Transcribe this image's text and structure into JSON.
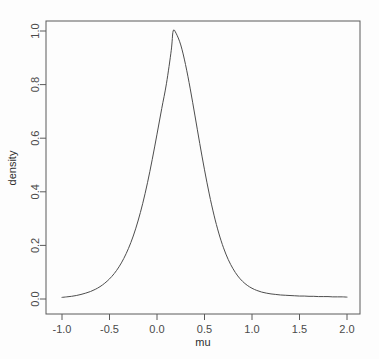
{
  "chart_data": {
    "type": "line",
    "title": "",
    "subtitle": "",
    "xlabel": "mu",
    "ylabel": "density",
    "xlim": [
      -1.0,
      2.0
    ],
    "ylim": [
      0.0,
      1.0
    ],
    "grid": false,
    "legend": null,
    "legend_position": "none",
    "box": true,
    "line_color": "#4d4d4d",
    "background_color": "#fdfdfd",
    "xticks": [
      -1.0,
      -0.5,
      0.0,
      0.5,
      1.0,
      1.5,
      2.0
    ],
    "xtick_labels": [
      "-1.0",
      "-0.5",
      "0.0",
      "0.5",
      "1.0",
      "1.5",
      "2.0"
    ],
    "yticks": [
      0.0,
      0.2,
      0.4,
      0.6,
      0.8,
      1.0
    ],
    "ytick_labels": [
      "0.0",
      "0.2",
      "0.4",
      "0.6",
      "0.8",
      "1.0"
    ],
    "series": [
      {
        "name": "density",
        "peak_x": 0.17,
        "peak_y": 1.0,
        "x": [
          -1.0,
          -0.95,
          -0.9,
          -0.85,
          -0.8,
          -0.75,
          -0.7,
          -0.65,
          -0.6,
          -0.55,
          -0.5,
          -0.45,
          -0.4,
          -0.35,
          -0.3,
          -0.25,
          -0.2,
          -0.15,
          -0.1,
          -0.05,
          0.0,
          0.05,
          0.1,
          0.15,
          0.17,
          0.2,
          0.25,
          0.3,
          0.35,
          0.4,
          0.45,
          0.5,
          0.55,
          0.6,
          0.65,
          0.7,
          0.75,
          0.8,
          0.85,
          0.9,
          0.95,
          1.0,
          1.05,
          1.1,
          1.15,
          1.2,
          1.25,
          1.3,
          1.35,
          1.4,
          1.45,
          1.5,
          1.55,
          1.6,
          1.65,
          1.7,
          1.75,
          1.8,
          1.85,
          1.9,
          1.95,
          2.0
        ],
        "y": [
          0.006,
          0.008,
          0.01,
          0.013,
          0.017,
          0.022,
          0.028,
          0.036,
          0.046,
          0.059,
          0.075,
          0.095,
          0.12,
          0.151,
          0.189,
          0.235,
          0.291,
          0.357,
          0.434,
          0.521,
          0.615,
          0.711,
          0.805,
          0.928,
          1.0,
          0.992,
          0.948,
          0.875,
          0.784,
          0.683,
          0.58,
          0.482,
          0.392,
          0.313,
          0.246,
          0.191,
          0.147,
          0.113,
          0.086,
          0.066,
          0.051,
          0.04,
          0.032,
          0.026,
          0.022,
          0.019,
          0.017,
          0.015,
          0.014,
          0.013,
          0.012,
          0.011,
          0.011,
          0.01,
          0.01,
          0.009,
          0.009,
          0.009,
          0.008,
          0.008,
          0.008,
          0.007
        ]
      }
    ]
  }
}
